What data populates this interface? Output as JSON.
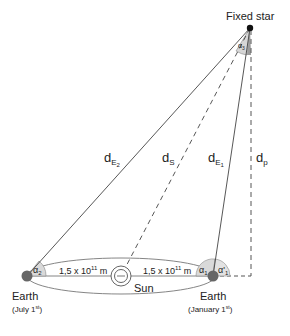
{
  "labels": {
    "fixed_star": "Fixed star",
    "sun": "Sun",
    "earth_left": "Earth",
    "earth_left_date": "(July 1",
    "earth_left_sup": "st",
    "earth_right": "Earth",
    "earth_right_date": "(January 1",
    "earth_right_sup": "st",
    "distance_left": "1,5 x 10",
    "distance_left_exp": "11",
    "distance_left_unit": " m",
    "distance_right": "1,5 x 10",
    "distance_right_exp": "11",
    "distance_right_unit": " m",
    "dE2": "d",
    "dE2_sub": "E",
    "dE2_subsub": "2",
    "dS": "d",
    "dS_sub": "S",
    "dE1": "d",
    "dE1_sub": "E",
    "dE1_subsub": "1",
    "dp": "d",
    "dp_sub": "p",
    "alpha2": "α",
    "alpha2_sub": "2",
    "alpha1": "α",
    "alpha1_sub": "1",
    "alpha1p": "α'",
    "alpha1p_sub": "1",
    "alpha3": "α",
    "alpha3_sub": "3",
    "close_paren": ")"
  },
  "colors": {
    "line": "#444444",
    "earth": "#666666",
    "angle_fill": "#d9d9d9",
    "angle_dark": "#9a9a9a"
  }
}
